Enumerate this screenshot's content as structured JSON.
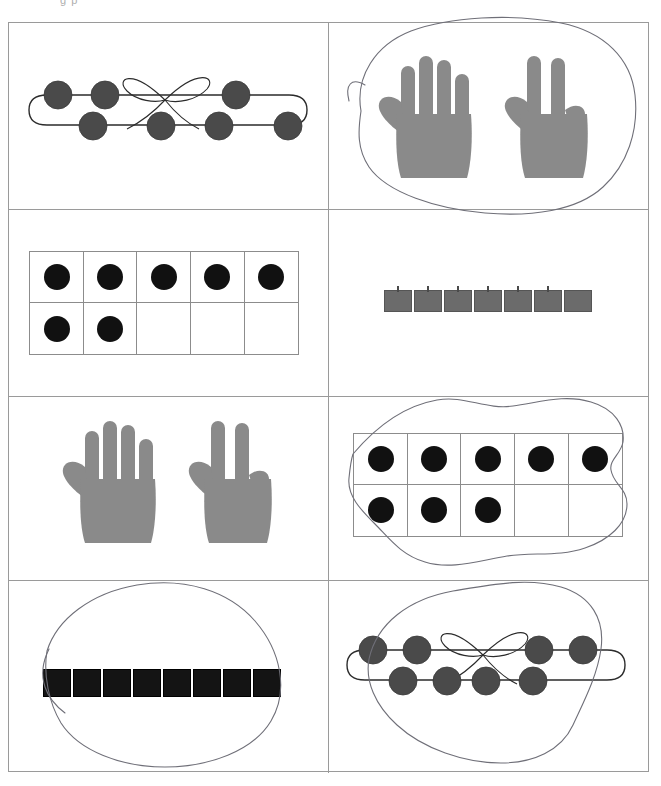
{
  "page": {
    "top_cropped_text": "g p",
    "width": 661,
    "height": 786,
    "background": "#ffffff",
    "border_color": "#9a9a9a"
  },
  "colors": {
    "bead_fill": "#4a4a4a",
    "bead_stroke": "#3a3a3a",
    "string_stroke": "#2b2b2b",
    "hand_fill": "#8a8a8a",
    "tenframe_dot": "#111111",
    "tenframe_border": "#8c8c8c",
    "cube_gray": "#6b6b6b",
    "cube_gray_stroke": "#555555",
    "cube_black": "#141414",
    "cube_black_stroke": "#000000",
    "pencil_mark": "#6f6f78",
    "grid_line": "#9a9a9a"
  },
  "grid": {
    "rows": 4,
    "columns": 2
  },
  "cells": [
    {
      "id": "cell-r1c1",
      "name": "bead-string-seven",
      "row": 1,
      "column": 1,
      "representation": "bead-string",
      "value": 7,
      "top_beads": 3,
      "bottom_beads": 4,
      "has_bow": true,
      "circled": false
    },
    {
      "id": "cell-r1c2",
      "name": "hands-five-and-two",
      "row": 1,
      "column": 2,
      "representation": "hands",
      "value": 7,
      "left_hand_fingers": 5,
      "right_hand_fingers": 2,
      "circled": true
    },
    {
      "id": "cell-r2c1",
      "name": "ten-frame-seven",
      "row": 2,
      "column": 1,
      "representation": "ten-frame",
      "value": 7,
      "top_row_filled": 5,
      "bottom_row_filled": 2,
      "circled": false
    },
    {
      "id": "cell-r2c2",
      "name": "cube-train-seven-gray",
      "row": 2,
      "column": 2,
      "representation": "cube-train",
      "value": 7,
      "cube_color": "gray",
      "circled": false
    },
    {
      "id": "cell-r3c1",
      "name": "hands-five-and-two-repeat",
      "row": 3,
      "column": 1,
      "representation": "hands",
      "value": 7,
      "left_hand_fingers": 5,
      "right_hand_fingers": 2,
      "circled": false
    },
    {
      "id": "cell-r3c2",
      "name": "ten-frame-eight",
      "row": 3,
      "column": 2,
      "representation": "ten-frame",
      "value": 8,
      "top_row_filled": 5,
      "bottom_row_filled": 3,
      "circled": true
    },
    {
      "id": "cell-r4c1",
      "name": "cube-train-eight-black",
      "row": 4,
      "column": 1,
      "representation": "cube-train",
      "value": 8,
      "cube_color": "black",
      "circled": true
    },
    {
      "id": "cell-r4c2",
      "name": "bead-string-eight",
      "row": 4,
      "column": 2,
      "representation": "bead-string",
      "value": 8,
      "top_beads": 4,
      "bottom_beads": 4,
      "has_bow": true,
      "circled": true
    }
  ]
}
